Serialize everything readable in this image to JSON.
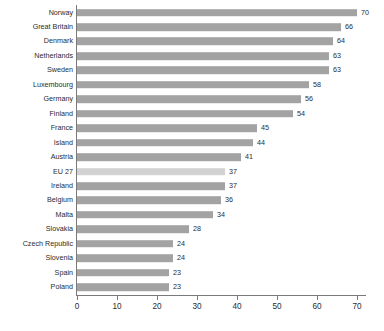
{
  "chart_data": {
    "type": "bar",
    "orientation": "horizontal",
    "title": "",
    "xlabel": "",
    "ylabel": "",
    "xlim": [
      0,
      70
    ],
    "xticks": [
      0,
      10,
      20,
      30,
      40,
      50,
      60,
      70
    ],
    "grid": false,
    "legend": null,
    "categories": [
      "Norway",
      "Great Britain",
      "Denmark",
      "Netherlands",
      "Sweden",
      "Luxembourg",
      "Germany",
      "Finland",
      "France",
      "Island",
      "Austria",
      "EU 27",
      "Ireland",
      "Belgium",
      "Malta",
      "Slovakia",
      "Czech Republic",
      "Slovenia",
      "Spain",
      "Poland"
    ],
    "values": [
      70,
      66,
      64,
      63,
      63,
      58,
      56,
      54,
      45,
      44,
      41,
      37,
      37,
      36,
      34,
      28,
      24,
      24,
      23,
      23
    ],
    "data_labels": [
      "70",
      "66",
      "64",
      "63",
      "63",
      "58",
      "56",
      "54",
      "45",
      "44",
      "41",
      "37",
      "37",
      "36",
      "34",
      "28",
      "24",
      "24",
      "23",
      "23"
    ],
    "highlight_category": "EU 27",
    "colors": {
      "bar": "#a3a3a3",
      "bar_highlight": "#d2d2d2",
      "axis": "#7a7a7a",
      "text": "#2b2b2b",
      "background": "#ffffff"
    }
  },
  "footnote": {
    "text": ""
  }
}
